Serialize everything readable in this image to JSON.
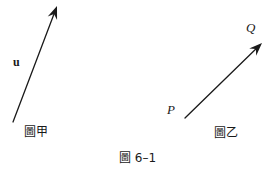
{
  "figure": {
    "caption": "圖 6–1",
    "background_color": "#ffffff",
    "ink_color": "#1a1a1a",
    "width": 278,
    "height": 174
  },
  "panels": [
    {
      "id": "panel-jia",
      "caption": "圖甲",
      "vector_label": "u",
      "description": "free vector u drawn as an arrow pointing up and to the right"
    },
    {
      "id": "panel-yi",
      "caption": "圖乙",
      "start_point_label": "P",
      "end_point_label": "Q",
      "description": "directed segment from point P to point Q"
    }
  ],
  "arrows": {
    "left": {
      "tail_x": 13,
      "tail_y": 122,
      "head_x": 57,
      "head_y": 6,
      "stroke_width": 1.3,
      "head_length": 13,
      "head_width": 5
    },
    "right": {
      "tail_x": 185,
      "tail_y": 118,
      "head_x": 262,
      "head_y": 43,
      "stroke_width": 1.3,
      "head_length": 13,
      "head_width": 5
    }
  }
}
